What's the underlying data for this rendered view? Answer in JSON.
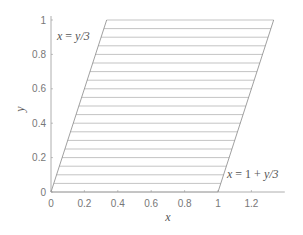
{
  "chart_data": {
    "type": "line",
    "title": "",
    "xlabel": "x",
    "ylabel": "y",
    "xlim": [
      0,
      1.4
    ],
    "ylim": [
      0,
      1
    ],
    "xticks": [
      0,
      0.2,
      0.4,
      0.6,
      0.8,
      1,
      1.2
    ],
    "xtick_labels": [
      "0",
      "0.2",
      "0.4",
      "0.6",
      "0.8",
      "1",
      "1.2"
    ],
    "yticks": [
      0,
      0.2,
      0.4,
      0.6,
      0.8,
      1
    ],
    "ytick_labels": [
      "0",
      "0.2",
      "0.4",
      "0.6",
      "0.8",
      "1"
    ],
    "grid": false,
    "legend": null,
    "region": {
      "description": "Parallelogram bounded by x = y/3 (left) and x = 1 + y/3 (right), for 0 <= y <= 1",
      "left_boundary": {
        "label": "x = y/3",
        "points": [
          [
            0,
            0
          ],
          [
            0.3333,
            1
          ]
        ]
      },
      "right_boundary": {
        "label": "x = 1 + y/3",
        "points": [
          [
            1,
            0
          ],
          [
            1.3333,
            1
          ]
        ]
      }
    },
    "series": [
      {
        "name": "horizontal slices",
        "y_values": [
          0,
          0.05,
          0.1,
          0.15,
          0.2,
          0.25,
          0.3,
          0.35,
          0.4,
          0.45,
          0.5,
          0.55,
          0.6,
          0.65,
          0.7,
          0.75,
          0.8,
          0.85,
          0.9,
          0.95,
          1.0
        ],
        "x_from": "y/3",
        "x_to": "1 + y/3"
      }
    ],
    "annotations": [
      {
        "text": "x = y/3",
        "near": [
          0.05,
          0.93
        ]
      },
      {
        "text": "x = 1 + y/3",
        "near": [
          1.03,
          0.1
        ]
      }
    ]
  },
  "labels": {
    "xlabel": "x",
    "ylabel": "y",
    "left_annotation": {
      "lhs": "x",
      "eq": " = ",
      "rhs": "y/3"
    },
    "right_annotation": {
      "lhs": "x",
      "eq": " = ",
      "mid": "1 + ",
      "rhs": "y/3"
    }
  },
  "colors": {
    "axis": "#999999",
    "boundary": "#888888",
    "slice": "#aaaaaa",
    "text": "#777777"
  }
}
